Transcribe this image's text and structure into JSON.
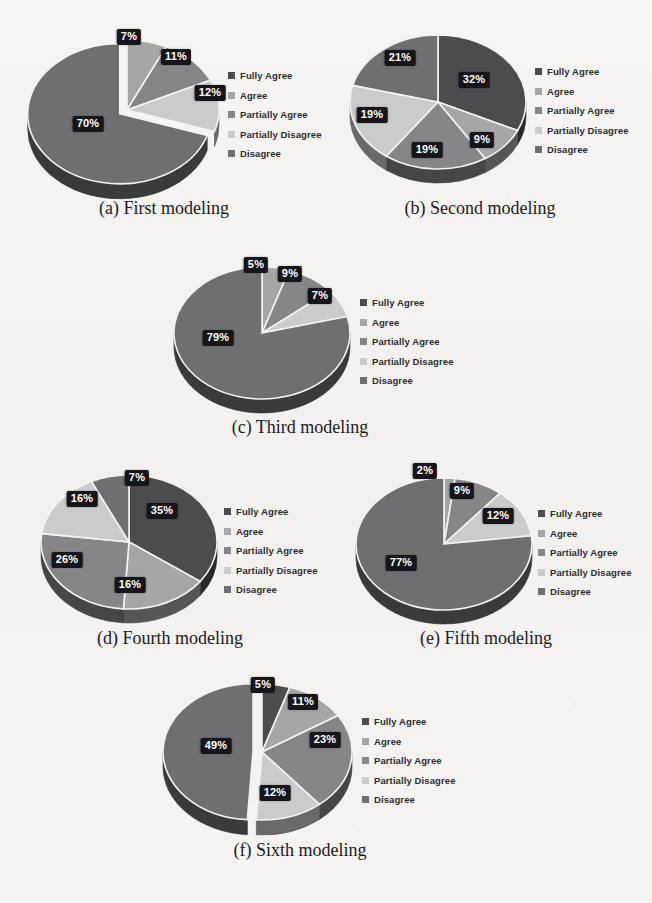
{
  "figure": {
    "background_color": "#f4f3f1",
    "label_box_color": "#16161a",
    "label_text_color": "#ffffff",
    "caption_color": "#1b1b1b",
    "legend_text_color": "#2d2d30",
    "palette": {
      "fully_agree": "#4c4c4e",
      "agree": "#a6a6a6",
      "partially_agree": "#868688",
      "partially_disagree": "#cbcbcb",
      "disagree": "#6f6f71"
    }
  },
  "legend_labels": [
    "Fully Agree",
    "Agree",
    "Partially Agree",
    "Partially Disagree",
    "Disagree"
  ],
  "chart_data": [
    {
      "id": "a",
      "type": "pie",
      "title": "(a) First modeling",
      "categories": [
        "Fully Agree",
        "Agree",
        "Partially Agree",
        "Partially Disagree",
        "Disagree"
      ],
      "values": [
        0,
        7,
        11,
        12,
        70
      ],
      "labels": [
        "",
        "7%",
        "11%",
        "12%",
        "70%"
      ],
      "colors": [
        "#4c4c4e",
        "#a6a6a6",
        "#868688",
        "#cbcbcb",
        "#6f6f71"
      ],
      "exploded": [
        "Disagree"
      ],
      "legend_position": "right",
      "three_d": true
    },
    {
      "id": "b",
      "type": "pie",
      "title": "(b) Second modeling",
      "categories": [
        "Fully Agree",
        "Agree",
        "Partially Agree",
        "Partially Disagree",
        "Disagree"
      ],
      "values": [
        32,
        9,
        19,
        19,
        21
      ],
      "labels": [
        "32%",
        "9%",
        "19%",
        "19%",
        "21%"
      ],
      "colors": [
        "#4c4c4e",
        "#a6a6a6",
        "#868688",
        "#cbcbcb",
        "#6f6f71"
      ],
      "exploded": [],
      "legend_position": "right",
      "three_d": true
    },
    {
      "id": "c",
      "type": "pie",
      "title": "(c) Third modeling",
      "categories": [
        "Fully Agree",
        "Agree",
        "Partially Agree",
        "Partially Disagree",
        "Disagree"
      ],
      "values": [
        0,
        5,
        9,
        7,
        79
      ],
      "labels": [
        "",
        "5%",
        "9%",
        "7%",
        "79%"
      ],
      "colors": [
        "#4c4c4e",
        "#a6a6a6",
        "#868688",
        "#cbcbcb",
        "#6f6f71"
      ],
      "exploded": [],
      "legend_position": "right",
      "three_d": true
    },
    {
      "id": "d",
      "type": "pie",
      "title": "(d) Fourth modeling",
      "categories": [
        "Fully Agree",
        "Agree",
        "Partially Agree",
        "Partially Disagree",
        "Disagree"
      ],
      "values": [
        35,
        16,
        26,
        16,
        7
      ],
      "labels": [
        "35%",
        "16%",
        "26%",
        "16%",
        "7%"
      ],
      "colors": [
        "#4c4c4e",
        "#a6a6a6",
        "#868688",
        "#cbcbcb",
        "#6f6f71"
      ],
      "exploded": [],
      "legend_position": "right",
      "three_d": true
    },
    {
      "id": "e",
      "type": "pie",
      "title": "(e) Fifth modeling",
      "categories": [
        "Fully Agree",
        "Agree",
        "Partially Agree",
        "Partially Disagree",
        "Disagree"
      ],
      "values": [
        0,
        2,
        9,
        12,
        77
      ],
      "labels": [
        "",
        "2%",
        "9%",
        "12%",
        "77%"
      ],
      "colors": [
        "#4c4c4e",
        "#a6a6a6",
        "#868688",
        "#cbcbcb",
        "#6f6f71"
      ],
      "exploded": [],
      "legend_position": "right",
      "three_d": true
    },
    {
      "id": "f",
      "type": "pie",
      "title": "(f) Sixth modeling",
      "categories": [
        "Fully Agree",
        "Agree",
        "Partially Agree",
        "Partially Disagree",
        "Disagree"
      ],
      "values": [
        5,
        11,
        23,
        12,
        49
      ],
      "labels": [
        "5%",
        "11%",
        "23%",
        "12%",
        "49%"
      ],
      "colors": [
        "#4c4c4e",
        "#a6a6a6",
        "#868688",
        "#cbcbcb",
        "#6f6f71"
      ],
      "exploded": [
        "Disagree"
      ],
      "legend_position": "right",
      "three_d": true
    }
  ],
  "layout": {
    "panels": [
      {
        "id": "a",
        "left": 14,
        "top": 10,
        "pie_cx": 113,
        "pie_cy": 100,
        "rx": 92,
        "ry": 70,
        "depth": 15,
        "legend_x": 214,
        "legend_y": 56,
        "caption_top": 188,
        "caption_width": 300
      },
      {
        "id": "b",
        "left": 330,
        "top": 10,
        "pie_cx": 108,
        "pie_cy": 92,
        "rx": 88,
        "ry": 67,
        "depth": 14,
        "legend_x": 205,
        "legend_y": 52,
        "caption_top": 188,
        "caption_width": 300
      },
      {
        "id": "c",
        "left": 150,
        "top": 245,
        "pie_cx": 112,
        "pie_cy": 88,
        "rx": 88,
        "ry": 66,
        "depth": 14,
        "legend_x": 210,
        "legend_y": 48,
        "caption_top": 172,
        "caption_width": 300
      },
      {
        "id": "d",
        "left": 22,
        "top": 452,
        "pie_cx": 107,
        "pie_cy": 90,
        "rx": 88,
        "ry": 67,
        "depth": 14,
        "legend_x": 202,
        "legend_y": 50,
        "caption_top": 176,
        "caption_width": 296
      },
      {
        "id": "e",
        "left": 338,
        "top": 452,
        "pie_cx": 106,
        "pie_cy": 92,
        "rx": 88,
        "ry": 66,
        "depth": 14,
        "legend_x": 200,
        "legend_y": 52,
        "caption_top": 176,
        "caption_width": 296
      },
      {
        "id": "f",
        "left": 150,
        "top": 662,
        "pie_cx": 112,
        "pie_cy": 90,
        "rx": 90,
        "ry": 68,
        "depth": 15,
        "legend_x": 212,
        "legend_y": 50,
        "caption_top": 178,
        "caption_width": 300
      }
    ],
    "label_positions": {
      "a": [
        null,
        {
          "x": 115,
          "y": 27
        },
        {
          "x": 162,
          "y": 47
        },
        {
          "x": 196,
          "y": 83
        },
        {
          "x": 74,
          "y": 114
        }
      ],
      "b": [
        {
          "x": 144,
          "y": 70
        },
        {
          "x": 152,
          "y": 130
        },
        {
          "x": 97,
          "y": 140
        },
        {
          "x": 42,
          "y": 105
        },
        {
          "x": 70,
          "y": 48
        }
      ],
      "c": [
        null,
        {
          "x": 106,
          "y": 20
        },
        {
          "x": 140,
          "y": 29
        },
        {
          "x": 170,
          "y": 51
        },
        {
          "x": 68,
          "y": 93
        }
      ],
      "d": [
        {
          "x": 140,
          "y": 59
        },
        {
          "x": 108,
          "y": 133
        },
        {
          "x": 45,
          "y": 108
        },
        {
          "x": 60,
          "y": 47
        },
        {
          "x": 115,
          "y": 26
        }
      ],
      "e": [
        null,
        {
          "x": 87,
          "y": 19
        },
        {
          "x": 124,
          "y": 39
        },
        {
          "x": 160,
          "y": 64
        },
        {
          "x": 63,
          "y": 111
        }
      ],
      "f": [
        {
          "x": 113,
          "y": 23
        },
        {
          "x": 153,
          "y": 40
        },
        {
          "x": 175,
          "y": 78
        },
        {
          "x": 125,
          "y": 131
        },
        {
          "x": 66,
          "y": 84
        }
      ]
    }
  }
}
